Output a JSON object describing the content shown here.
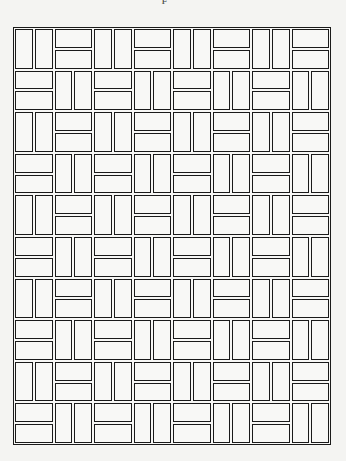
{
  "figure": {
    "label": "F",
    "columns": 8,
    "rows": 10,
    "line_color": "#1a1a1a",
    "background_color": "#f4f4f2",
    "cell_legend": {
      "V": "two vertical bricks side by side",
      "H": "two horizontal bricks stacked"
    },
    "pattern": [
      [
        "V",
        "H",
        "V",
        "H",
        "V",
        "H",
        "V",
        "H"
      ],
      [
        "H",
        "V",
        "H",
        "V",
        "H",
        "V",
        "H",
        "V"
      ],
      [
        "V",
        "H",
        "V",
        "H",
        "V",
        "H",
        "V",
        "H"
      ],
      [
        "H",
        "V",
        "H",
        "V",
        "H",
        "V",
        "H",
        "V"
      ],
      [
        "V",
        "H",
        "V",
        "H",
        "V",
        "H",
        "V",
        "H"
      ],
      [
        "H",
        "V",
        "H",
        "V",
        "H",
        "V",
        "H",
        "V"
      ],
      [
        "V",
        "H",
        "V",
        "H",
        "V",
        "H",
        "V",
        "H"
      ],
      [
        "H",
        "V",
        "H",
        "V",
        "H",
        "V",
        "H",
        "V"
      ],
      [
        "V",
        "H",
        "V",
        "H",
        "V",
        "H",
        "V",
        "H"
      ],
      [
        "H",
        "V",
        "H",
        "V",
        "H",
        "V",
        "H",
        "V"
      ]
    ]
  }
}
